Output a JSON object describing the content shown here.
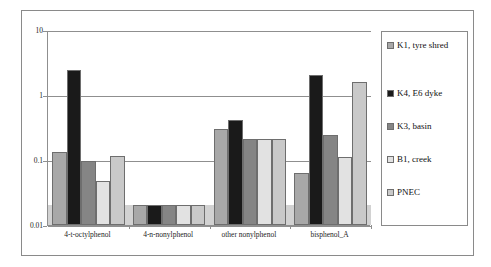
{
  "chart_data": {
    "type": "bar",
    "title": "",
    "subtitle": "",
    "xlabel": "",
    "ylabel": "",
    "yscale": "log",
    "ylim": [
      0.01,
      10
    ],
    "ytick_labels": [
      "10",
      "1",
      "0.1",
      "0.01"
    ],
    "ytick_values": [
      10,
      1,
      0.1,
      0.01
    ],
    "grid": true,
    "legend_position": "right",
    "categories": [
      "4-t-octylphenol",
      "4-n-nonylphenol",
      "other nonylphenol",
      "bisphenol_A"
    ],
    "series": [
      {
        "name": "K1, tyre shred",
        "color": "#a8a8a8",
        "values": [
          0.135,
          0.02,
          0.3,
          0.063
        ]
      },
      {
        "name": "K4, E6 dyke",
        "color": "#1a1a1a",
        "values": [
          2.4,
          0.02,
          0.42,
          2.0
        ]
      },
      {
        "name": "K3, basin",
        "color": "#858585",
        "values": [
          0.097,
          0.02,
          0.21,
          0.24
        ]
      },
      {
        "name": "B1, creek",
        "color": "#e2e2e2",
        "values": [
          0.048,
          0.02,
          0.21,
          0.11
        ]
      },
      {
        "name": "PNEC",
        "color": "#c9c9c9",
        "values": [
          0.115,
          0.02,
          0.21,
          1.6
        ]
      }
    ],
    "pnec_band_value": 0.02
  },
  "legend": {
    "items": [
      {
        "label": "K1, tyre shred",
        "color": "#a8a8a8"
      },
      {
        "label": "K4, E6 dyke",
        "color": "#1a1a1a"
      },
      {
        "label": "K3, basin",
        "color": "#858585"
      },
      {
        "label": "B1, creek",
        "color": "#e2e2e2"
      },
      {
        "label": "PNEC",
        "color": "#c9c9c9"
      }
    ]
  }
}
